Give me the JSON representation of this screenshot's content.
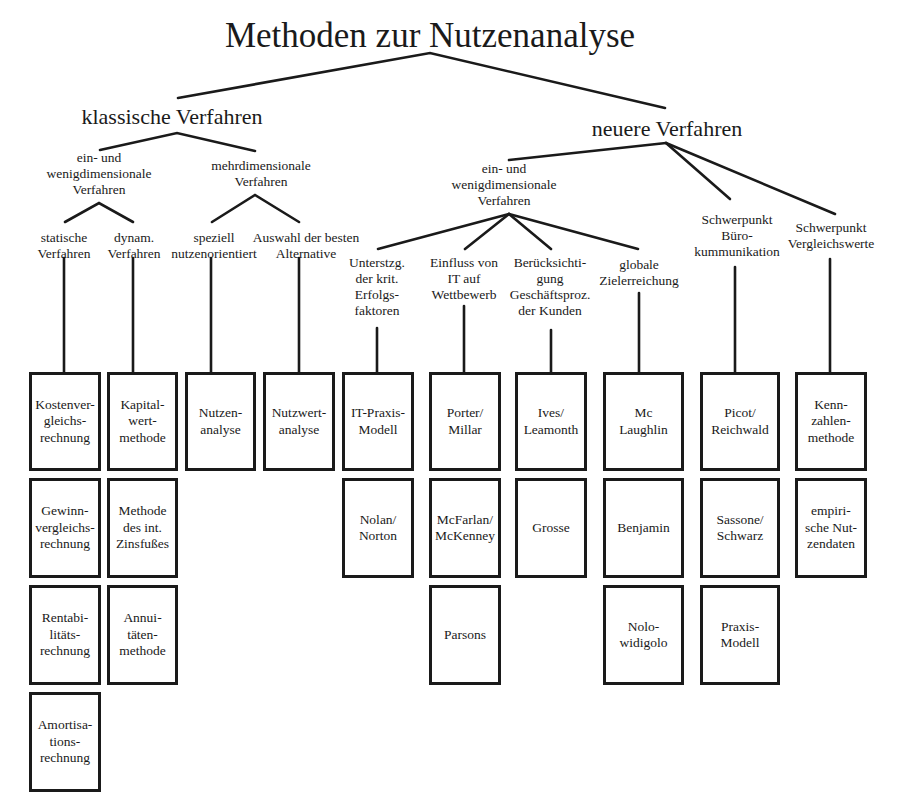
{
  "title": "Methoden zur Nutzenanalyse",
  "branches": {
    "classic": {
      "label": "klassische Verfahren",
      "groups": [
        {
          "label": "ein- und\nwenigdimensionale\nVerfahren",
          "sub": [
            {
              "label": "statische\nVerfahren",
              "boxes": [
                "Kostenver-\ngleichs-\nrechnung",
                "Gewinn-\nvergleichs-\nrechnung",
                "Rentabi-\nlitäts-\nrechnung",
                "Amortisa-\ntions-\nrechnung"
              ]
            },
            {
              "label": "dynam.\nVerfahren",
              "boxes": [
                "Kapital-\nwert-\nmethode",
                "Methode\ndes int.\nZinsfußes",
                "Annui-\ntäten-\nmethode"
              ]
            }
          ]
        },
        {
          "label": "mehrdimensionale\nVerfahren",
          "sub": [
            {
              "label": "speziell\nnutzenorientiert",
              "boxes": [
                "Nutzen-\nanalyse"
              ]
            },
            {
              "label": "Auswahl der besten\nAlternative",
              "boxes": [
                "Nutzwert-\nanalyse"
              ]
            }
          ]
        }
      ]
    },
    "newer": {
      "label": "neuere Verfahren",
      "groups": [
        {
          "label": "ein- und\nwenigdimensionale\nVerfahren",
          "sub": [
            {
              "label": "Unterstzg.\nder krit.\nErfolgs-\nfaktoren",
              "boxes": [
                "IT-Praxis-\nModell",
                "Nolan/\nNorton"
              ]
            },
            {
              "label": "Einfluss von\nIT auf\nWettbewerb",
              "boxes": [
                "Porter/\nMillar",
                "McFarlan/\nMcKenney",
                "Parsons"
              ]
            },
            {
              "label": "Berücksichti-\ngung\nGeschäftsproz.\nder Kunden",
              "boxes": [
                "Ives/\nLeamonth",
                "Grosse"
              ]
            },
            {
              "label": "globale\nZielerreichung",
              "boxes": [
                "Mc\nLaughlin",
                "Benjamin",
                "Nolo-\nwidigolo"
              ]
            }
          ]
        },
        {
          "label": "Schwerpunkt\nBüro-\nkummunikation",
          "boxes": [
            "Picot/\nReichwald",
            "Sassone/\nSchwarz",
            "Praxis-\nModell"
          ]
        },
        {
          "label": "Schwerpunkt\nVergleichswerte",
          "boxes": [
            "Kenn-\nzahlen-\nmethode",
            "empiri-\nsche Nut-\nzendaten"
          ]
        }
      ]
    }
  },
  "colors": {
    "line": "#1a1a1a",
    "background": "#ffffff"
  }
}
